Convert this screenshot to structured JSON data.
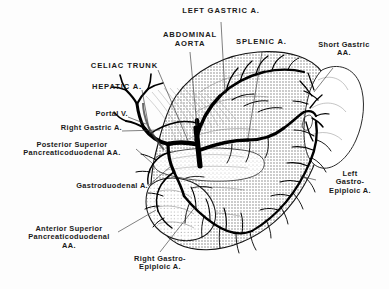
{
  "figure": {
    "background_color": "#fdfdfd",
    "ink_color": "#1a1a1a",
    "style": "halftone line drawing"
  },
  "labels": [
    {
      "id": "left-gastric",
      "text": "LEFT GASTRIC A.",
      "case": "caps"
    },
    {
      "id": "abdominal-aorta",
      "text": "ABDOMINAL\nAORTA",
      "case": "caps"
    },
    {
      "id": "splenic",
      "text": "SPLENIC A.",
      "case": "caps"
    },
    {
      "id": "short-gastric",
      "text": "Short Gastric\nAA.",
      "case": "mixed"
    },
    {
      "id": "celiac-trunk",
      "text": "CELIAC TRUNK",
      "case": "caps"
    },
    {
      "id": "hepatic",
      "text": "HEPATIC A.",
      "case": "caps"
    },
    {
      "id": "portal-vein",
      "text": "Portal V.",
      "case": "mixed"
    },
    {
      "id": "right-gastric",
      "text": "Right Gastric A.",
      "case": "mixed"
    },
    {
      "id": "post-sup-pd",
      "text": "Posterior Superior\nPancreaticoduodenal AA.",
      "case": "mixed"
    },
    {
      "id": "gastroduodenal",
      "text": "Gastroduodenal A.",
      "case": "mixed"
    },
    {
      "id": "ant-sup-pd",
      "text": "Anterior Superior\nPancreaticoduodenal\nAA.",
      "case": "mixed"
    },
    {
      "id": "left-gastroepiploic",
      "text": "Left\nGastro-\nEpiploic A.",
      "case": "mixed"
    },
    {
      "id": "right-gastroepiploic",
      "text": "Right Gastro-\nEpiploic A.",
      "case": "mixed"
    }
  ],
  "structures": [
    {
      "id": "stomach",
      "name": "stomach body and fundus",
      "fill": "halftone"
    },
    {
      "id": "spleen",
      "name": "spleen",
      "fill": "outline"
    },
    {
      "id": "duodenum",
      "name": "duodenum",
      "fill": "halftone"
    },
    {
      "id": "pancreas",
      "name": "pancreas",
      "fill": "stipple"
    },
    {
      "id": "arteries",
      "name": "arterial tree",
      "fill": "solid-black"
    }
  ]
}
